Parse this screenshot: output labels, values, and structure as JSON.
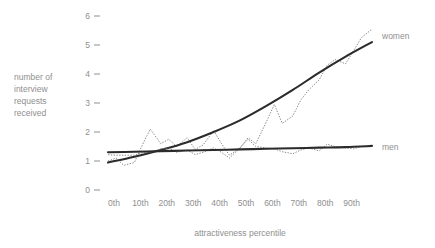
{
  "chart_data": {
    "type": "line",
    "title": "",
    "xlabel": "attractiveness percentile",
    "ylabel": "number of interview requests received",
    "ylabel_lines": [
      "number of",
      "interview",
      "requests",
      "received"
    ],
    "categories": [
      "0th",
      "10th",
      "20th",
      "30th",
      "40th",
      "50th",
      "60th",
      "70th",
      "80th",
      "90th"
    ],
    "x_tick_labels": [
      "0th",
      "10th",
      "20th",
      "30th",
      "40th",
      "50th",
      "60th",
      "70th",
      "80th",
      "90th"
    ],
    "y_tick_labels": [
      "0",
      "1",
      "2",
      "3",
      "4",
      "5",
      "6"
    ],
    "y_tick_values": [
      0,
      1,
      2,
      3,
      4,
      5,
      6
    ],
    "ylim": [
      0,
      6
    ],
    "xlim": [
      0,
      100
    ],
    "grid": false,
    "legend_position": "right-inline",
    "series": [
      {
        "name": "women",
        "label": "women",
        "style": "dotted-raw",
        "color": "#7d7d7d",
        "x": [
          0,
          3,
          6,
          10,
          13,
          16,
          20,
          23,
          26,
          30,
          33,
          36,
          40,
          43,
          46,
          50,
          53,
          56,
          60,
          63,
          66,
          70,
          73,
          76,
          80,
          83,
          86,
          90,
          93,
          96,
          100
        ],
        "values": [
          1.0,
          1.1,
          0.85,
          0.95,
          1.55,
          2.1,
          1.6,
          1.75,
          1.5,
          1.8,
          1.4,
          1.55,
          2.05,
          1.6,
          1.2,
          1.45,
          1.8,
          1.6,
          2.35,
          2.95,
          2.3,
          2.55,
          3.1,
          3.45,
          3.8,
          4.3,
          4.5,
          4.35,
          4.8,
          5.25,
          5.55
        ]
      },
      {
        "name": "women-trend",
        "label": "women",
        "style": "smooth-fit",
        "color": "#2b2b2b",
        "x": [
          0,
          10,
          20,
          30,
          40,
          50,
          60,
          70,
          80,
          90,
          100
        ],
        "values": [
          0.95,
          1.15,
          1.38,
          1.65,
          2.0,
          2.4,
          2.9,
          3.45,
          4.05,
          4.6,
          5.1
        ]
      },
      {
        "name": "men",
        "label": "men",
        "style": "dotted-raw",
        "color": "#7d7d7d",
        "x": [
          0,
          3,
          6,
          10,
          13,
          16,
          20,
          23,
          26,
          30,
          33,
          36,
          40,
          43,
          46,
          50,
          53,
          56,
          60,
          63,
          66,
          70,
          73,
          76,
          80,
          83,
          86,
          90,
          93,
          96,
          100
        ],
        "values": [
          1.22,
          1.2,
          1.2,
          1.2,
          1.28,
          1.3,
          1.42,
          1.45,
          1.3,
          1.38,
          1.22,
          1.3,
          1.45,
          1.3,
          1.1,
          1.45,
          1.75,
          1.5,
          1.45,
          1.42,
          1.32,
          1.25,
          1.38,
          1.45,
          1.35,
          1.58,
          1.5,
          1.45,
          1.42,
          1.5,
          1.52
        ]
      },
      {
        "name": "men-trend",
        "label": "men",
        "style": "smooth-fit",
        "color": "#2b2b2b",
        "x": [
          0,
          10,
          20,
          30,
          40,
          50,
          60,
          70,
          80,
          90,
          100
        ],
        "values": [
          1.3,
          1.32,
          1.34,
          1.36,
          1.38,
          1.4,
          1.42,
          1.44,
          1.46,
          1.48,
          1.52
        ]
      }
    ],
    "annotations": [
      {
        "text": "women",
        "value": 5.3
      },
      {
        "text": "men",
        "value": 1.5
      }
    ]
  },
  "colors": {
    "text": "#8f8f8f",
    "raw_line": "#7d7d7d",
    "fit_line": "#2b2b2b",
    "background": "#ffffff"
  }
}
